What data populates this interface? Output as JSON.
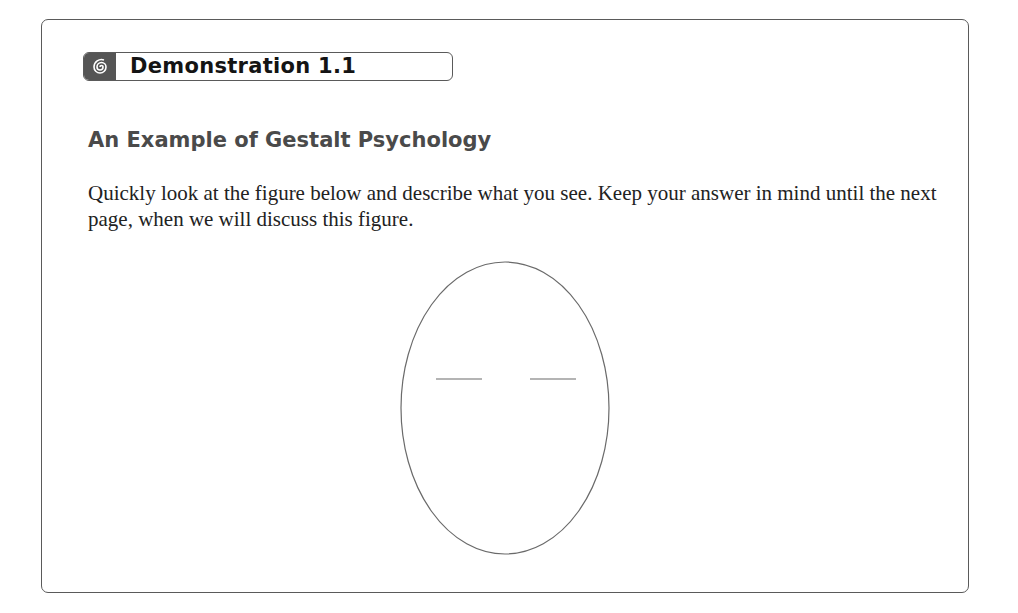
{
  "demonstration": {
    "label": "Demonstration 1.1",
    "icon": "spiral-icon",
    "title": "An Example of Gestalt Psychology",
    "instructions": "Quickly look at the figure below and describe what you see. Keep your answer in mind until the next page, when we will discuss this figure."
  },
  "figure": {
    "stroke_color": "#6a6a6a"
  }
}
